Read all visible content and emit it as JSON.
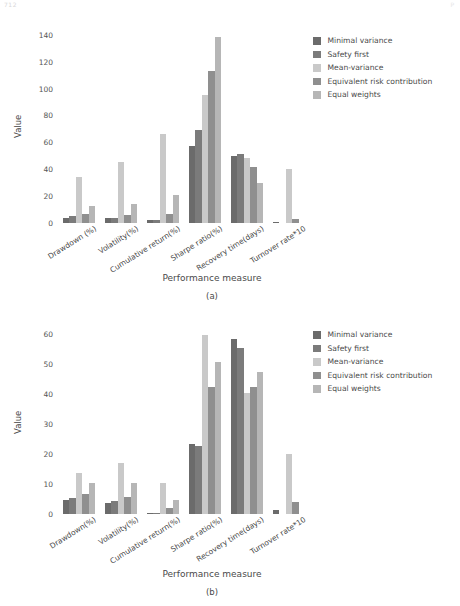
{
  "page": {
    "header_left": "712",
    "header_right": "P"
  },
  "series_colors": [
    "#6b6b6b",
    "#7b7b7b",
    "#c9c9c9",
    "#8f8f8f",
    "#b6b6b6"
  ],
  "legend": {
    "items": [
      {
        "label": "Minimal variance"
      },
      {
        "label": "Safety first"
      },
      {
        "label": "Mean-variance"
      },
      {
        "label": "Equivalent risk contribution"
      },
      {
        "label": "Equal weights"
      }
    ]
  },
  "chart_data": [
    {
      "id": "a",
      "type": "bar",
      "title": "",
      "caption": "(a)",
      "xlabel": "Performance measure",
      "ylabel": "Value",
      "grid": false,
      "legend_position": "top-right",
      "ylim": [
        0,
        145
      ],
      "yticks": [
        0,
        20,
        40,
        60,
        80,
        100,
        120,
        140
      ],
      "categories": [
        "Drawdown (%)",
        "Volatility(%)",
        "Cumulative return(%)",
        "Sharpe ratio(%)",
        "Recovery time(days)",
        "Turnover rate*10"
      ],
      "series": [
        {
          "name": "Minimal variance",
          "values": [
            4,
            4,
            2,
            57,
            50,
            1
          ]
        },
        {
          "name": "Safety first",
          "values": [
            5,
            4,
            2,
            69,
            51,
            0
          ]
        },
        {
          "name": "Mean-variance",
          "values": [
            34,
            45,
            66,
            95,
            48,
            40
          ]
        },
        {
          "name": "Equivalent risk contribution",
          "values": [
            7,
            6,
            7,
            113,
            42,
            3
          ]
        },
        {
          "name": "Equal weights",
          "values": [
            13,
            14,
            21,
            138,
            30,
            0
          ]
        }
      ]
    },
    {
      "id": "b",
      "type": "bar",
      "title": "",
      "caption": "(b)",
      "xlabel": "Performance measure",
      "ylabel": "Value",
      "grid": false,
      "legend_position": "top-right",
      "ylim": [
        0,
        62
      ],
      "yticks": [
        0,
        10,
        20,
        30,
        40,
        50,
        60
      ],
      "categories": [
        "Drawdown(%)",
        "Volatility(%)",
        "Cumulative return(%)",
        "Sharpe ratio(%)",
        "Recovery time(days)",
        "Turnover rate*10"
      ],
      "series": [
        {
          "name": "Minimal variance",
          "values": [
            4.7,
            3.7,
            0.5,
            23.3,
            58.3,
            1.4
          ]
        },
        {
          "name": "Safety first",
          "values": [
            5.3,
            4.2,
            0.3,
            22.7,
            55.3,
            0
          ]
        },
        {
          "name": "Mean-variance",
          "values": [
            13.7,
            17.0,
            10.5,
            59.8,
            40.3,
            20.0
          ]
        },
        {
          "name": "Equivalent risk contribution",
          "values": [
            6.8,
            5.7,
            2.0,
            42.5,
            42.5,
            4.1
          ]
        },
        {
          "name": "Equal weights",
          "values": [
            10.3,
            10.3,
            4.8,
            50.8,
            47.2,
            0
          ]
        }
      ]
    }
  ]
}
